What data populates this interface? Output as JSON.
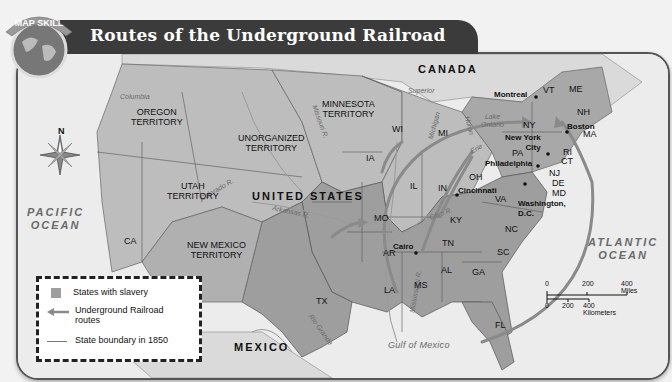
{
  "badge": {
    "label": "MAP SKILL",
    "icon": "globe-icon"
  },
  "title": "Routes of the Underground Railroad",
  "compass": {
    "north_label": "N",
    "icon": "compass-rose-icon"
  },
  "countries": {
    "canada": "CANADA",
    "united_states": "UNITED STATES",
    "mexico": "MEXICO"
  },
  "water": {
    "pacific": "PACIFIC OCEAN",
    "pacific_line1": "PACIFIC",
    "pacific_line2": "OCEAN",
    "atlantic_line1": "ATLANTIC",
    "atlantic_line2": "OCEAN",
    "gulf": "Gulf of Mexico",
    "lake_superior": "Superior",
    "lake_michigan": "Michigan",
    "lake_huron": "Huron",
    "lake_erie": "Erie",
    "lake_ontario_line1": "Lake",
    "lake_ontario_line2": "Ontario"
  },
  "rivers": {
    "columbia": "Columbia",
    "missouri": "Missouri R.",
    "colorado": "Colorado R.",
    "arkansas": "Arkansas R.",
    "mississippi": "Mississippi R.",
    "ohio": "Ohio R.",
    "rio_grande": "Rio Grande"
  },
  "territories": {
    "oregon": [
      "OREGON",
      "TERRITORY"
    ],
    "utah": [
      "UTAH",
      "TERRITORY"
    ],
    "new_mexico": [
      "NEW MEXICO",
      "TERRITORY"
    ],
    "unorganized": [
      "UNORGANIZED",
      "TERRITORY"
    ],
    "minnesota": [
      "MINNESOTA",
      "TERRITORY"
    ]
  },
  "states": [
    "CA",
    "TX",
    "IA",
    "WI",
    "MI",
    "IL",
    "IN",
    "OH",
    "MO",
    "KY",
    "TN",
    "AR",
    "LA",
    "MS",
    "AL",
    "GA",
    "FL",
    "SC",
    "NC",
    "VA",
    "MD",
    "DE",
    "NJ",
    "PA",
    "NY",
    "CT",
    "RI",
    "MA",
    "NH",
    "VT",
    "ME"
  ],
  "state_labels": {
    "CA": "CA",
    "TX": "TX",
    "IA": "IA",
    "WI": "WI",
    "MI": "MI",
    "IL": "IL",
    "IN": "IN",
    "OH": "OH",
    "MO": "MO",
    "KY": "KY",
    "TN": "TN",
    "AR": "AR",
    "LA": "LA",
    "MS": "MS",
    "AL": "AL",
    "GA": "GA",
    "FL": "FL",
    "SC": "SC",
    "NC": "NC",
    "VA": "VA",
    "MD": "MD",
    "DE": "DE",
    "NJ": "NJ",
    "PA": "PA",
    "NY": "NY",
    "CT": "CT",
    "RI": "RI",
    "MA": "MA",
    "NH": "NH",
    "VT": "VT",
    "ME": "ME"
  },
  "cities": {
    "montreal": "Montreal",
    "boston": "Boston",
    "new_york_line1": "New York",
    "new_york_line2": "City",
    "philadelphia": "Philadelphia",
    "washington_line1": "Washington,",
    "washington_line2": "D.C.",
    "cincinnati": "Cincinnati",
    "cairo": "Cairo"
  },
  "legend": {
    "slavery": "States with slavery",
    "routes_line1": "Underground Railroad",
    "routes_line2": "routes",
    "boundary": "State boundary in 1850"
  },
  "scale": {
    "miles_ticks": [
      "0",
      "200",
      "400 Miles"
    ],
    "km_ticks": [
      "0",
      "200",
      "400 Kilometers"
    ]
  },
  "colors": {
    "slave_states": "#9e9e9e",
    "free_states": "#bdbdbd",
    "foreign_land": "#d9d9d9",
    "water": "#ececec",
    "routes": "#8a8a8a",
    "title_band": "#3b3b3b"
  }
}
